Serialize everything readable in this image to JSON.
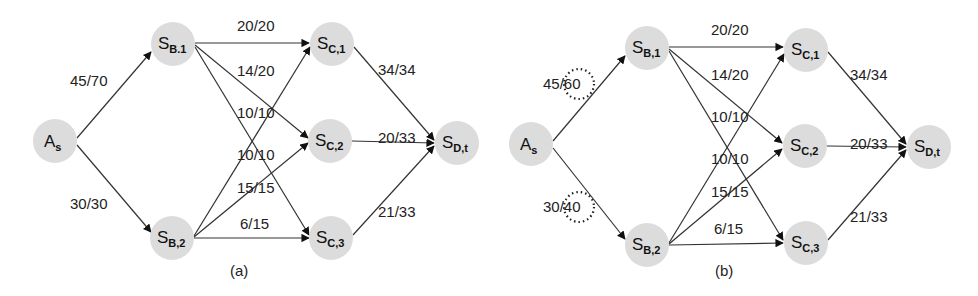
{
  "diagrams": [
    {
      "caption": "(a)",
      "nodes": {
        "As": {
          "main": "A",
          "sub": "s",
          "x": 55,
          "y": 141
        },
        "SB1": {
          "main": "S",
          "sub": "B.1",
          "x": 173,
          "y": 44
        },
        "SB2": {
          "main": "S",
          "sub": "B,2",
          "x": 172,
          "y": 238
        },
        "SC1": {
          "main": "S",
          "sub": "C,1",
          "x": 332,
          "y": 44
        },
        "SC2": {
          "main": "S",
          "sub": "C,2",
          "x": 330,
          "y": 141
        },
        "SC3": {
          "main": "S",
          "sub": "C,3",
          "x": 331,
          "y": 238
        },
        "SDt": {
          "main": "S",
          "sub": "D,t",
          "x": 457,
          "y": 143
        }
      },
      "edges": [
        {
          "from": "As",
          "to": "SB1",
          "label": "45/70"
        },
        {
          "from": "As",
          "to": "SB2",
          "label": "30/30"
        },
        {
          "from": "SB1",
          "to": "SC1",
          "label": "20/20"
        },
        {
          "from": "SB1",
          "to": "SC2",
          "label": "14/20"
        },
        {
          "from": "SB1",
          "to": "SC3",
          "label": "10/10"
        },
        {
          "from": "SB2",
          "to": "SC1",
          "label": "10/10"
        },
        {
          "from": "SB2",
          "to": "SC2",
          "label": "15/15"
        },
        {
          "from": "SB2",
          "to": "SC3",
          "label": "6/15"
        },
        {
          "from": "SC1",
          "to": "SDt",
          "label": "34/34"
        },
        {
          "from": "SC2",
          "to": "SDt",
          "label": "20/33"
        },
        {
          "from": "SC3",
          "to": "SDt",
          "label": "21/33"
        }
      ]
    },
    {
      "caption": "(b)",
      "nodes": {
        "As": {
          "main": "A",
          "sub": "s",
          "x": 531,
          "y": 144
        },
        "SB1": {
          "main": "S",
          "sub": "B,1",
          "x": 647,
          "y": 48
        },
        "SB2": {
          "main": "S",
          "sub": "B,2",
          "x": 647,
          "y": 245
        },
        "SC1": {
          "main": "S",
          "sub": "C,1",
          "x": 806,
          "y": 50
        },
        "SC2": {
          "main": "S",
          "sub": "C,2",
          "x": 805,
          "y": 146
        },
        "SC3": {
          "main": "S",
          "sub": "C,3",
          "x": 806,
          "y": 243
        },
        "SDt": {
          "main": "S",
          "sub": "D,t",
          "x": 929,
          "y": 147
        }
      },
      "edges": [
        {
          "from": "As",
          "to": "SB1",
          "label": "45/60",
          "highlighted": true
        },
        {
          "from": "As",
          "to": "SB2",
          "label": "30/40",
          "highlighted": true
        },
        {
          "from": "SB1",
          "to": "SC1",
          "label": "20/20"
        },
        {
          "from": "SB1",
          "to": "SC2",
          "label": "14/20"
        },
        {
          "from": "SB1",
          "to": "SC3",
          "label": "10/10"
        },
        {
          "from": "SB2",
          "to": "SC1",
          "label": "10/10"
        },
        {
          "from": "SB2",
          "to": "SC2",
          "label": "15/15"
        },
        {
          "from": "SB2",
          "to": "SC3",
          "label": "6/15"
        },
        {
          "from": "SC1",
          "to": "SDt",
          "label": "34/34"
        },
        {
          "from": "SC2",
          "to": "SDt",
          "label": "20/33"
        },
        {
          "from": "SC3",
          "to": "SDt",
          "label": "21/33"
        }
      ]
    }
  ],
  "colors": {
    "node_fill": "#dcdcdc",
    "edge": "#333333",
    "text": "#222222"
  }
}
